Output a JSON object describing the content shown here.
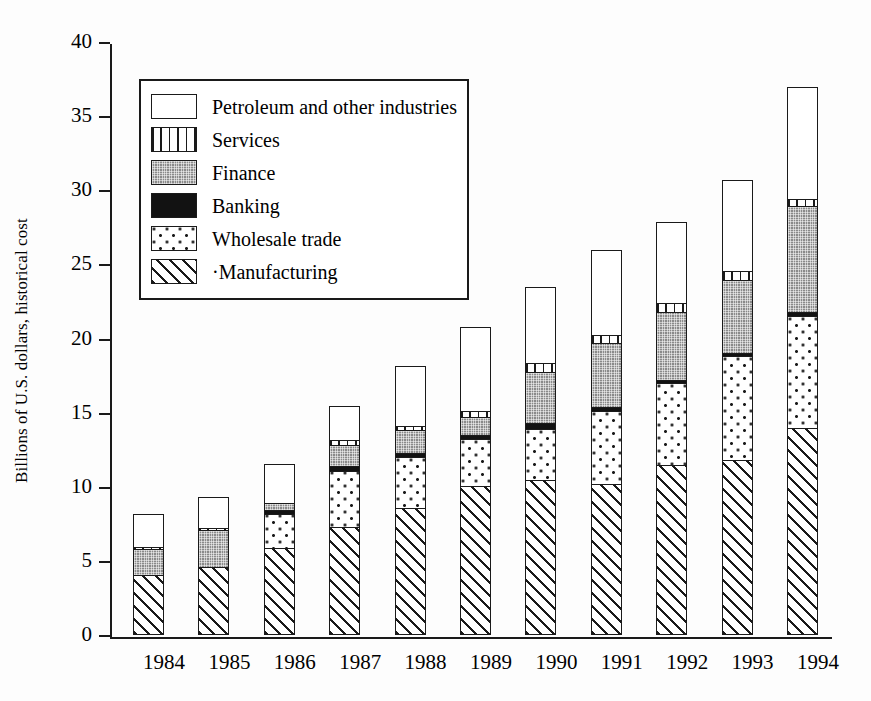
{
  "chart_data": {
    "type": "bar",
    "subtype": "stacked-bar",
    "title": "",
    "xlabel": "",
    "ylabel": "Billions of U.S. dollars, historical cost",
    "ylim": [
      0,
      40
    ],
    "ytick_values": [
      0,
      5,
      10,
      15,
      20,
      25,
      30,
      35,
      40
    ],
    "ytick_labels": [
      "0",
      "5",
      "10",
      "15",
      "20",
      "25",
      "30",
      "35",
      "40"
    ],
    "grid": false,
    "legend_position": "upper-left-inside",
    "stack_order_bottom_to_top": [
      "Manufacturing",
      "Wholesale trade",
      "Banking",
      "Finance",
      "Services",
      "Petroleum and other industries"
    ],
    "categories": [
      "1984",
      "1985",
      "1986",
      "1987",
      "1988",
      "1989",
      "1990",
      "1991",
      "1992",
      "1993",
      "1994"
    ],
    "series": [
      {
        "name": "Manufacturing",
        "pattern": "diagonal-hatch",
        "values": [
          4.1,
          4.6,
          5.9,
          7.3,
          8.6,
          10.1,
          10.5,
          10.2,
          11.5,
          11.8,
          14.0
        ]
      },
      {
        "name": "Wholesale trade",
        "pattern": "sparse-dots",
        "values": [
          0.0,
          0.0,
          2.4,
          3.9,
          3.5,
          3.2,
          3.5,
          5.0,
          5.6,
          7.1,
          7.6
        ]
      },
      {
        "name": "Banking",
        "pattern": "solid-black",
        "values": [
          0.0,
          0.0,
          0.3,
          0.4,
          0.4,
          0.4,
          0.5,
          0.4,
          0.3,
          0.3,
          0.4
        ]
      },
      {
        "name": "Finance",
        "pattern": "gray-fine-dot",
        "values": [
          1.8,
          2.6,
          0.6,
          1.5,
          1.6,
          1.3,
          3.5,
          4.4,
          4.7,
          5.0,
          7.2
        ]
      },
      {
        "name": "Services",
        "pattern": "vertical-stripes",
        "values": [
          0.2,
          0.2,
          0.0,
          0.4,
          0.4,
          0.5,
          0.7,
          0.6,
          0.7,
          0.7,
          0.6
        ]
      },
      {
        "name": "Petroleum and other industries",
        "pattern": "white",
        "values": [
          2.3,
          2.2,
          2.7,
          2.4,
          4.1,
          5.7,
          5.2,
          5.8,
          5.5,
          6.2,
          7.6
        ]
      }
    ],
    "totals": [
      8.4,
      9.6,
      11.9,
      15.9,
      18.6,
      21.2,
      23.9,
      26.4,
      28.3,
      31.1,
      37.4
    ]
  },
  "legend": {
    "items": [
      {
        "label": "Petroleum and other industries",
        "swatch": "white"
      },
      {
        "label": "Services",
        "swatch": "vertical-stripes"
      },
      {
        "label": "Finance",
        "swatch": "gray-fine-dot"
      },
      {
        "label": "Banking",
        "swatch": "solid-black"
      },
      {
        "label": "Wholesale trade",
        "swatch": "sparse-dots"
      },
      {
        "label": "·Manufacturing",
        "swatch": "diagonal-hatch"
      }
    ]
  },
  "colors": {
    "axis": "#1a1a1a",
    "background": "#ffffff",
    "finance_fill": "#8a8a8a",
    "banking_fill": "#121212"
  }
}
